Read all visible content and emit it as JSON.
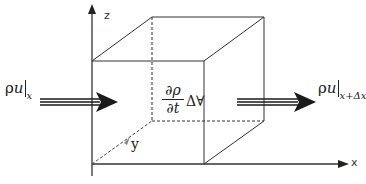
{
  "diagram": {
    "title": "",
    "axes": {
      "x_label": "x",
      "y_label": "y",
      "z_label": "z"
    },
    "inflow": {
      "symbol": "ρ",
      "variable": "u",
      "subscript": "x"
    },
    "outflow": {
      "symbol": "ρ",
      "variable": "u",
      "subscript": "x+Δx"
    },
    "storage_term": {
      "numerator": "∂ρ",
      "denominator": "∂t",
      "volume": "Δ∀"
    },
    "colors": {
      "line": "#333333",
      "arrow": "#1a1a1a",
      "background": "#ffffff"
    }
  }
}
